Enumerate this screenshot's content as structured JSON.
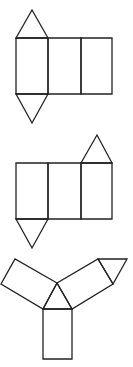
{
  "diagram": {
    "stroke_color": "#222222",
    "background": "#ffffff",
    "figures": [
      {
        "id": "net-1",
        "description": "Three rectangles in a row with triangles on top and bottom of the left rectangle",
        "polygons": [
          {
            "name": "rect-left",
            "points": "16,38 48,38 48,94 16,94"
          },
          {
            "name": "rect-middle",
            "points": "48,38 81,38 81,94 48,94"
          },
          {
            "name": "rect-right",
            "points": "81,38 112,38 112,94 81,94"
          },
          {
            "name": "triangle-top",
            "points": "16,38 32,10 48,38"
          },
          {
            "name": "triangle-bottom",
            "points": "16,94 32,123 48,94"
          }
        ]
      },
      {
        "id": "net-2",
        "description": "Three rectangles in a row with a triangle on top of the right rectangle and one below the left rectangle",
        "polygons": [
          {
            "name": "rect-left",
            "points": "16,163 48,163 48,219 16,219"
          },
          {
            "name": "rect-middle",
            "points": "48,163 81,163 81,219 48,219"
          },
          {
            "name": "rect-right",
            "points": "81,163 112,163 112,219 81,219"
          },
          {
            "name": "triangle-top",
            "points": "81,163 97,135 112,163"
          },
          {
            "name": "triangle-bottom",
            "points": "16,219 32,248 48,219"
          }
        ]
      },
      {
        "id": "net-3",
        "description": "Central triangle with three rectangles radiating from its sides and a triangle on the end of the right rectangle",
        "polygons": [
          {
            "name": "triangle-center",
            "points": "57,283 72,309 43,309"
          },
          {
            "name": "rect-left-arm",
            "points": "57,283 15,259 1,284 43,309"
          },
          {
            "name": "rect-right-arm",
            "points": "57,283 98,259 113,284 72,309"
          },
          {
            "name": "rect-bottom-arm",
            "points": "43,309 72,309 72,359 43,359"
          },
          {
            "name": "triangle-end",
            "points": "98,259 127,259 113,284"
          }
        ]
      }
    ]
  }
}
